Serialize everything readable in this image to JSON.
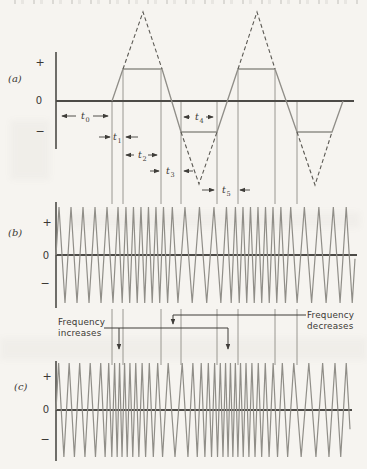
{
  "colors": {
    "background": "#f6f4f0",
    "axis": "#4d4b47",
    "waveform": "#908e88",
    "dashed": "#5b5953",
    "guide": "#8f8d87",
    "annotation": "#3f3d39",
    "text": "#3a3834"
  },
  "panels": {
    "a": {
      "label": "(a)",
      "plus": "+",
      "zero": "0",
      "minus": "−"
    },
    "b": {
      "label": "(b)",
      "plus": "+",
      "zero": "0",
      "minus": "−"
    },
    "c": {
      "label": "(c)",
      "plus": "+",
      "zero": "0",
      "minus": "−"
    }
  },
  "annotations": {
    "increases_line1": "Frequency",
    "increases_line2": "increases",
    "decreases_line1": "Frequency",
    "decreases_line2": "decreases"
  },
  "chart_data": [
    {
      "type": "line",
      "id": "a",
      "title": "modulating-signal-trapezoid-with-dashed-triangle-peaks",
      "axis": {
        "x": 56,
        "y_top": 52,
        "y_bottom": 149,
        "zero_y": 101,
        "x_end": 354
      },
      "solid_points": [
        [
          112,
          101
        ],
        [
          123,
          69
        ],
        [
          162,
          69
        ],
        [
          181,
          132
        ],
        [
          217,
          132
        ],
        [
          238,
          69
        ],
        [
          275,
          69
        ],
        [
          297,
          132
        ],
        [
          332,
          132
        ],
        [
          343,
          101
        ]
      ],
      "dashed_segments": [
        [
          [
            123,
            69
          ],
          [
            143,
            12
          ],
          [
            162,
            69
          ]
        ],
        [
          [
            181,
            132
          ],
          [
            199,
            184
          ],
          [
            217,
            132
          ]
        ],
        [
          [
            238,
            69
          ],
          [
            257,
            12
          ],
          [
            275,
            69
          ]
        ],
        [
          [
            297,
            132
          ],
          [
            315,
            185
          ],
          [
            332,
            132
          ]
        ]
      ]
    },
    {
      "type": "line",
      "id": "b",
      "title": "fm-wave-of-trapezoid-modulation",
      "axis": {
        "x": 56,
        "y_top": 202,
        "y_bottom": 308,
        "zero_y": 255,
        "x_end": 357,
        "wave_end": 355
      },
      "amplitude": 48,
      "freq_profile": [
        [
          56,
          0.0833
        ],
        [
          112,
          0.0833
        ],
        [
          123,
          0.1333
        ],
        [
          162,
          0.1333
        ],
        [
          181,
          0.069
        ],
        [
          217,
          0.069
        ],
        [
          238,
          0.1333
        ],
        [
          275,
          0.1333
        ],
        [
          297,
          0.069
        ],
        [
          332,
          0.069
        ],
        [
          345,
          0.0833
        ],
        [
          355,
          0.0833
        ]
      ]
    },
    {
      "type": "line",
      "id": "c",
      "title": "fm-wave-of-triangle-modulation",
      "axis": {
        "x": 56,
        "y_top": 361,
        "y_bottom": 461,
        "zero_y": 410,
        "x_end": 352,
        "wave_end": 350
      },
      "amplitude": 47,
      "freq_profile": [
        [
          56,
          0.095
        ],
        [
          100,
          0.095
        ],
        [
          118,
          0.21
        ],
        [
          176,
          0.062
        ],
        [
          230,
          0.21
        ],
        [
          300,
          0.062
        ],
        [
          350,
          0.095
        ]
      ]
    }
  ],
  "guides": {
    "x_positions": [
      112,
      123,
      161,
      181,
      217,
      238,
      275,
      297
    ],
    "upper": {
      "y_tops": [
        101,
        70,
        70,
        101,
        101,
        70,
        70,
        101
      ],
      "y_bottom": 204
    },
    "lower": {
      "y_top": 309,
      "y_bottom": 365
    }
  },
  "callout_paths": {
    "increases_main": "M104,328 H228 V349",
    "increases_branch": "M119,328 V349",
    "decreases_main": "M306,315 H173 V324"
  },
  "time_markers": [
    {
      "base": "t",
      "sub": "0",
      "label_x": 81,
      "label_y": 119,
      "arrows": [
        {
          "x1": 76,
          "y1": 116,
          "x2": 62,
          "y2": 116
        },
        {
          "x1": 93,
          "y1": 116,
          "x2": 108,
          "y2": 116
        }
      ]
    },
    {
      "base": "t",
      "sub": "1",
      "label_x": 113,
      "label_y": 140,
      "arrows": [
        {
          "x1": 99,
          "y1": 137,
          "x2": 110,
          "y2": 137
        },
        {
          "x1": 138,
          "y1": 137,
          "x2": 126,
          "y2": 137
        }
      ]
    },
    {
      "base": "t",
      "sub": "2",
      "label_x": 138,
      "label_y": 158,
      "arrows": [
        {
          "x1": 134,
          "y1": 155,
          "x2": 126,
          "y2": 155
        },
        {
          "x1": 148,
          "y1": 155,
          "x2": 157,
          "y2": 155
        }
      ]
    },
    {
      "base": "t",
      "sub": "3",
      "label_x": 166,
      "label_y": 174,
      "arrows": [
        {
          "x1": 150,
          "y1": 171,
          "x2": 159,
          "y2": 171
        },
        {
          "x1": 193,
          "y1": 171,
          "x2": 184,
          "y2": 171
        }
      ]
    },
    {
      "base": "t",
      "sub": "4",
      "label_x": 195,
      "label_y": 120,
      "arrows": [
        {
          "x1": 190,
          "y1": 117,
          "x2": 184,
          "y2": 117
        },
        {
          "x1": 206,
          "y1": 117,
          "x2": 213,
          "y2": 117
        }
      ]
    },
    {
      "base": "t",
      "sub": "5",
      "label_x": 222,
      "label_y": 193,
      "arrows": [
        {
          "x1": 202,
          "y1": 190,
          "x2": 214,
          "y2": 190
        },
        {
          "x1": 250,
          "y1": 190,
          "x2": 240,
          "y2": 190
        }
      ]
    }
  ]
}
